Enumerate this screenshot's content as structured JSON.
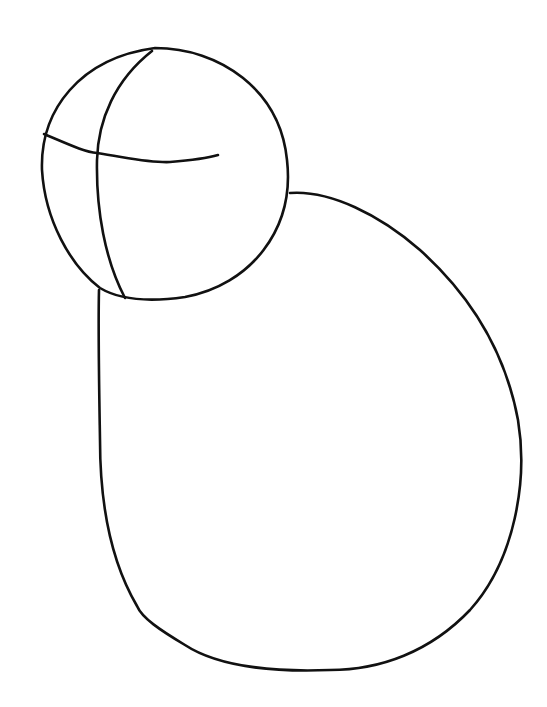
{
  "image": {
    "subject": "line-sketch",
    "description": "Pencil-style construction sketch: a sphere head with guideline cross and a large pear-shaped body",
    "background_color": "#ffffff",
    "stroke_color": "#111111"
  },
  "shapes": {
    "head": "head-sphere",
    "vertical_guide": "head-vertical-guideline",
    "horizontal_guide": "head-horizontal-guideline",
    "body": "body-pear-shape"
  }
}
